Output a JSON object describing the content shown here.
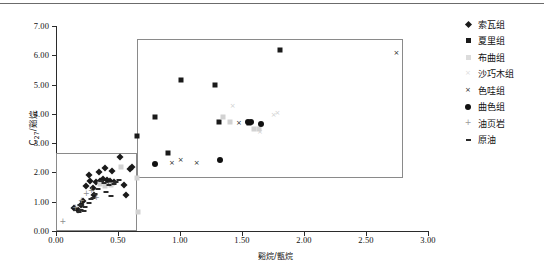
{
  "chart_data": {
    "type": "scatter",
    "title": "",
    "xlabel": "谿烷/甑烷",
    "ylabel": "C₂₇/谿烷",
    "xlim": [
      0.0,
      3.0
    ],
    "ylim": [
      0.0,
      7.0
    ],
    "xticks": [
      "0.00",
      "0.50",
      "1.00",
      "1.50",
      "2.00",
      "2.50",
      "3.00"
    ],
    "yticks": [
      "0.00",
      "1.00",
      "2.00",
      "3.00",
      "4.00",
      "5.00",
      "6.00",
      "7.00"
    ],
    "xtick_values": [
      0.0,
      0.5,
      1.0,
      1.5,
      2.0,
      2.5,
      3.0
    ],
    "ytick_values": [
      0.0,
      1.0,
      2.0,
      3.0,
      4.0,
      5.0,
      6.0,
      7.0
    ],
    "grid": false,
    "legend_position": "right",
    "annotations": [
      {
        "name": "lower-left-field",
        "type": "rect",
        "x0": 0.0,
        "y0": 0.0,
        "x1": 0.65,
        "y1": 2.65
      },
      {
        "name": "upper-right-field",
        "type": "rect",
        "x0": 0.65,
        "y0": 1.82,
        "x1": 2.8,
        "y1": 6.55
      }
    ],
    "series": [
      {
        "name": "索瓦组",
        "marker": "diamond",
        "color": "#1a1a1a",
        "points": [
          [
            0.145,
            0.78
          ],
          [
            0.175,
            0.72
          ],
          [
            0.205,
            0.88
          ],
          [
            0.215,
            1.02
          ],
          [
            0.245,
            1.52
          ],
          [
            0.265,
            1.9
          ],
          [
            0.275,
            1.72
          ],
          [
            0.295,
            1.47
          ],
          [
            0.305,
            1.22
          ],
          [
            0.325,
            1.68
          ],
          [
            0.345,
            2.02
          ],
          [
            0.355,
            1.7
          ],
          [
            0.375,
            1.76
          ],
          [
            0.395,
            2.15
          ],
          [
            0.415,
            1.74
          ],
          [
            0.435,
            1.7
          ],
          [
            0.445,
            1.64
          ],
          [
            0.455,
            2.06
          ],
          [
            0.465,
            1.69
          ],
          [
            0.515,
            2.52
          ],
          [
            0.545,
            1.56
          ],
          [
            0.565,
            1.22
          ],
          [
            0.595,
            2.12
          ],
          [
            0.615,
            2.18
          ]
        ]
      },
      {
        "name": "夏里组",
        "marker": "square",
        "color": "#1a1a1a",
        "points": [
          [
            0.655,
            3.25
          ],
          [
            0.795,
            3.88
          ],
          [
            1.005,
            5.15
          ],
          [
            1.285,
            4.97
          ],
          [
            0.905,
            2.68
          ],
          [
            1.315,
            3.72
          ],
          [
            1.555,
            3.7
          ],
          [
            1.805,
            6.18
          ]
        ]
      },
      {
        "name": "布曲组",
        "marker": "square-light",
        "color": "#d2d2d2",
        "points": [
          [
            0.355,
            1.62
          ],
          [
            0.395,
            1.55
          ],
          [
            0.445,
            1.58
          ],
          [
            0.525,
            2.18
          ],
          [
            1.345,
            3.88
          ],
          [
            1.405,
            3.72
          ],
          [
            1.595,
            3.5
          ],
          [
            1.635,
            3.48
          ],
          [
            0.655,
            1.8
          ],
          [
            0.665,
            0.66
          ]
        ]
      },
      {
        "name": "沙巧木组",
        "marker": "cross-light",
        "color": "#cfcfcf",
        "points": [
          [
            1.425,
            4.25
          ],
          [
            1.755,
            3.95
          ],
          [
            1.785,
            4.02
          ],
          [
            1.645,
            3.38
          ]
        ]
      },
      {
        "name": "色哇组",
        "marker": "cross",
        "color": "#1a1a1a",
        "points": [
          [
            0.935,
            2.32
          ],
          [
            1.005,
            2.4
          ],
          [
            1.135,
            2.32
          ],
          [
            1.475,
            3.66
          ],
          [
            2.745,
            6.05
          ]
        ]
      },
      {
        "name": "曲色组",
        "marker": "circle",
        "color": "#111111",
        "points": [
          [
            0.795,
            2.28
          ],
          [
            1.325,
            2.42
          ],
          [
            1.545,
            3.72
          ],
          [
            1.575,
            3.72
          ],
          [
            1.655,
            3.66
          ]
        ]
      },
      {
        "name": "油页岩",
        "marker": "plus",
        "color": "#8d8d8d",
        "points": [
          [
            0.055,
            0.3
          ],
          [
            0.155,
            0.8
          ],
          [
            0.205,
            1.02
          ],
          [
            0.245,
            1.25
          ],
          [
            0.285,
            1.38
          ],
          [
            0.325,
            1.14
          ]
        ]
      },
      {
        "name": "原油",
        "marker": "dash",
        "color": "#2a2a2a",
        "points": [
          [
            0.185,
            0.66
          ],
          [
            0.205,
            0.72
          ],
          [
            0.225,
            0.68
          ],
          [
            0.235,
            0.82
          ],
          [
            0.265,
            0.94
          ],
          [
            0.285,
            1.08
          ],
          [
            0.295,
            1.14
          ],
          [
            0.315,
            1.26
          ],
          [
            0.335,
            1.44
          ],
          [
            0.365,
            1.7
          ],
          [
            0.385,
            1.64
          ],
          [
            0.405,
            1.32
          ],
          [
            0.425,
            1.56
          ],
          [
            0.445,
            1.18
          ],
          [
            0.465,
            1.62
          ],
          [
            0.485,
            1.66
          ],
          [
            0.505,
            1.74
          ],
          [
            0.195,
            0.9
          ]
        ]
      }
    ]
  },
  "legend": {
    "items": [
      {
        "label": "索瓦组",
        "marker": "diamond"
      },
      {
        "label": "夏里组",
        "marker": "square"
      },
      {
        "label": "布曲组",
        "marker": "square-light"
      },
      {
        "label": "沙巧木组",
        "marker": "cross-light"
      },
      {
        "label": "色哇组",
        "marker": "cross"
      },
      {
        "label": "曲色组",
        "marker": "circle"
      },
      {
        "label": "油页岩",
        "marker": "plus"
      },
      {
        "label": "原油",
        "marker": "dash"
      }
    ]
  },
  "axis_titles": {
    "y_main": "C",
    "y_sub": "27",
    "y_rest": "/谿烷",
    "x": "谿烷/甑烷"
  }
}
